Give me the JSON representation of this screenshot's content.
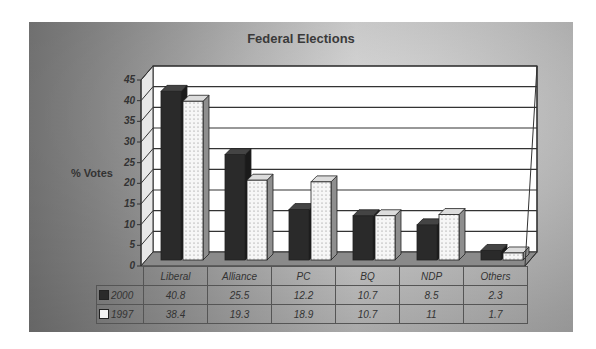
{
  "chart_data": {
    "type": "bar",
    "title": "Federal Elections",
    "xlabel": "",
    "ylabel": "% Votes",
    "ylim": [
      0,
      45
    ],
    "yticks": [
      0,
      5,
      10,
      15,
      20,
      25,
      30,
      35,
      40,
      45
    ],
    "grid": true,
    "style": "3d-clustered-column with data table",
    "categories": [
      "Liberal",
      "Alliance",
      "PC",
      "BQ",
      "NDP",
      "Others"
    ],
    "series": [
      {
        "name": "2000",
        "color": "#2a2a2a",
        "values": [
          40.8,
          25.5,
          12.2,
          10.7,
          8.5,
          2.3
        ]
      },
      {
        "name": "1997",
        "color": "#f4f4f4",
        "pattern": "dotted",
        "values": [
          38.4,
          19.3,
          18.9,
          10.7,
          11,
          1.7
        ]
      }
    ],
    "legend_position": "data-table"
  },
  "table": {
    "rows": [
      {
        "label": "2000",
        "cells": [
          "40.8",
          "25.5",
          "12.2",
          "10.7",
          "8.5",
          "2.3"
        ]
      },
      {
        "label": "1997",
        "cells": [
          "38.4",
          "19.3",
          "18.9",
          "10.7",
          "11",
          "1.7"
        ]
      }
    ]
  }
}
